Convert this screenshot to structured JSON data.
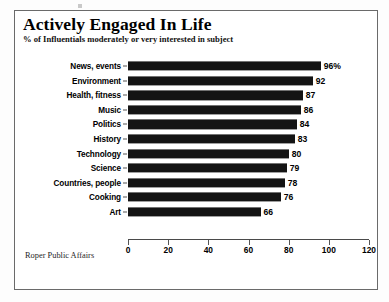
{
  "chart_data": {
    "type": "bar",
    "orientation": "horizontal",
    "title": "Actively Engaged In Life",
    "subtitle": "% of Influentials moderately or very interested in subject",
    "source": "Roper Public Affairs",
    "xlabel": "",
    "ylabel": "",
    "xlim": [
      0,
      120
    ],
    "xticks": [
      0,
      20,
      40,
      60,
      80,
      100,
      120
    ],
    "grid": false,
    "legend": null,
    "bar_color": "#141414",
    "categories": [
      "News, events",
      "Environment",
      "Health, fitness",
      "Music",
      "Politics",
      "History",
      "Technology",
      "Science",
      "Countries, people",
      "Cooking",
      "Art"
    ],
    "values": [
      96,
      92,
      87,
      86,
      84,
      83,
      80,
      79,
      78,
      76,
      66
    ],
    "value_labels": [
      "96%",
      "92",
      "87",
      "86",
      "84",
      "83",
      "80",
      "79",
      "78",
      "76",
      "66"
    ]
  }
}
